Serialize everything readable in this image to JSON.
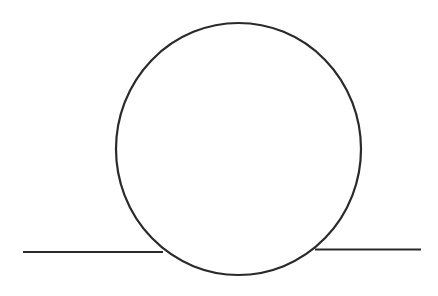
{
  "diagram": {
    "title": "",
    "stroke_color": "#2a2a2a",
    "background": "#ffffff",
    "stroke_width": 2.2,
    "circle": {
      "cx": 238.5,
      "cy": 149,
      "rx": 122.5,
      "ry": 126
    },
    "left_line": {
      "x1": 23,
      "y1": 252,
      "x2": 163,
      "y2": 252
    },
    "right_line": {
      "x1": 315,
      "y1": 249.5,
      "x2": 421,
      "y2": 249.5
    }
  }
}
